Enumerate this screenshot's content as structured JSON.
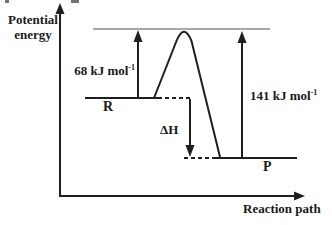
{
  "figure": {
    "background_color": "#ffffff",
    "line_color": "#1f1f1f",
    "reference_line_color": "#a8a8a8",
    "text_color": "#1a1a1a",
    "y_axis_label": {
      "line1": "Potential",
      "line2": "energy"
    },
    "x_axis_label": "Reaction path",
    "reactant_label": "R",
    "product_label": "P",
    "delta_h_label": "ΔH",
    "forward_activation_energy": {
      "text": "68 kJ mol",
      "superscript": "-1"
    },
    "reverse_activation_energy": {
      "text": "141 kJ mol",
      "superscript": "-1"
    }
  },
  "energy_profile": {
    "reactant": "R",
    "product": "P",
    "activation_energy_from_reactant": "68 kJ mol-1",
    "activation_energy_from_product": "141 kJ mol-1",
    "enthalpy_change_symbol": "ΔH",
    "reaction_type": "exothermic (P level drawn below R level)"
  }
}
